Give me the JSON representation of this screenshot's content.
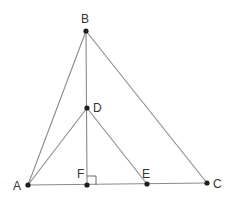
{
  "diagram": {
    "type": "geometry",
    "colors": {
      "line": "#8a8a8a",
      "point": "#1e1e1e",
      "label": "#333333",
      "background": "#ffffff"
    },
    "points": [
      {
        "id": "A",
        "label": "A",
        "x": 28,
        "y": 185,
        "label_x": 13,
        "label_y": 190
      },
      {
        "id": "B",
        "label": "B",
        "x": 86,
        "y": 31,
        "label_x": 81,
        "label_y": 23
      },
      {
        "id": "C",
        "label": "C",
        "x": 207,
        "y": 183,
        "label_x": 213,
        "label_y": 188
      },
      {
        "id": "D",
        "label": "D",
        "x": 87,
        "y": 108,
        "label_x": 93,
        "label_y": 112
      },
      {
        "id": "E",
        "label": "E",
        "x": 147,
        "y": 184,
        "label_x": 142,
        "label_y": 178
      },
      {
        "id": "F",
        "label": "F",
        "x": 87,
        "y": 185,
        "label_x": 77,
        "label_y": 178
      }
    ],
    "segments": [
      {
        "from": "A",
        "to": "B"
      },
      {
        "from": "B",
        "to": "C"
      },
      {
        "from": "A",
        "to": "C"
      },
      {
        "from": "B",
        "to": "F"
      },
      {
        "from": "A",
        "to": "D"
      },
      {
        "from": "D",
        "to": "E"
      }
    ],
    "right_angle": {
      "at": "F",
      "size": 9
    }
  }
}
